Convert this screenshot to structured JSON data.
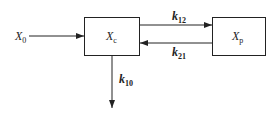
{
  "diagram": {
    "type": "two-compartment-model",
    "input": {
      "label": "X",
      "sub": "0"
    },
    "compartments": [
      {
        "id": "central",
        "label": "X",
        "sub": "c"
      },
      {
        "id": "peripheral",
        "label": "X",
        "sub": "p"
      }
    ],
    "rates": [
      {
        "id": "k12",
        "label": "k",
        "sub": "12",
        "from": "central",
        "to": "peripheral"
      },
      {
        "id": "k21",
        "label": "k",
        "sub": "21",
        "from": "peripheral",
        "to": "central"
      },
      {
        "id": "k10",
        "label": "k",
        "sub": "10",
        "from": "central",
        "to": "elimination"
      }
    ],
    "colors": {
      "stroke": "#222222",
      "background": "#ffffff"
    }
  }
}
